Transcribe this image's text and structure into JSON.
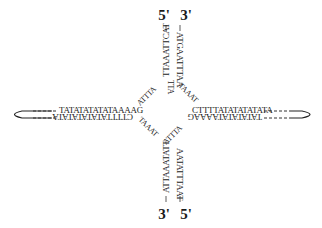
{
  "diagram": {
    "title": "",
    "type": "Holliday junction / cruciform DNA structure",
    "top_arm": {
      "end_labels": [
        "5'",
        "3'"
      ],
      "strand_left": "TTAAATTCAT",
      "strand_right": "ATGAATTTAA"
    },
    "bottom_arm": {
      "end_labels": [
        "3'",
        "5'"
      ],
      "strand_left": "ATTAAATATT",
      "strand_right": "AATATTTAAT"
    },
    "left_arm": {
      "strand_top": "TATATATATATAAAAG",
      "strand_bottom": "CTTTTATATATATATA",
      "loop": "hairpin-loop"
    },
    "right_arm": {
      "strand_top": "CTTTTATATATATATA",
      "strand_bottom": "TATATATATAAAAG",
      "loop": "hairpin-loop"
    },
    "junction": {
      "top_left": "ATTTA",
      "top_right_outer": "TTA",
      "top_right": "TAAAT",
      "bottom_left": "TAAAT",
      "bottom_right": "ATTTA"
    }
  }
}
